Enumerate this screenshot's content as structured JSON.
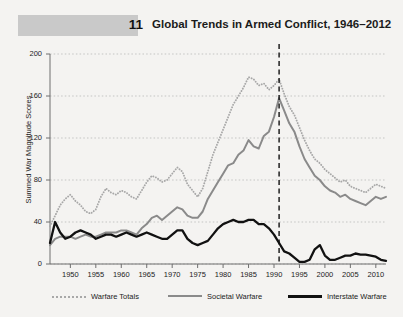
{
  "figure": {
    "number": "11",
    "title": "Global Trends in Armed Conflict, 1946–2012"
  },
  "colors": {
    "background": "#f4f3f1",
    "band": "#c9c9c9",
    "warfare_totals": "#a8a8a8",
    "societal_warfare": "#8a8a8a",
    "interstate_warfare": "#111111",
    "gridline": "#b9b9b9",
    "axis": "#6f6f6f",
    "marker_line": "#111111"
  },
  "chart_data": {
    "type": "line",
    "title": "Global Trends in Armed Conflict, 1946–2012",
    "xlabel": "",
    "ylabel": "Summed War Magnitude Scores",
    "xlim": [
      1946,
      2012
    ],
    "ylim": [
      0,
      200
    ],
    "grid": true,
    "legend_position": "bottom",
    "y_ticks": [
      0,
      40,
      80,
      120,
      160,
      200
    ],
    "x_ticks": [
      1950,
      1955,
      1960,
      1965,
      1970,
      1975,
      1980,
      1985,
      1990,
      1995,
      2000,
      2005,
      2010
    ],
    "annotations": [
      {
        "type": "vline",
        "x": 1991,
        "style": "dashed",
        "color": "#111111"
      }
    ],
    "x": [
      1946,
      1947,
      1948,
      1949,
      1950,
      1951,
      1952,
      1953,
      1954,
      1955,
      1956,
      1957,
      1958,
      1959,
      1960,
      1961,
      1962,
      1963,
      1964,
      1965,
      1966,
      1967,
      1968,
      1969,
      1970,
      1971,
      1972,
      1973,
      1974,
      1975,
      1976,
      1977,
      1978,
      1979,
      1980,
      1981,
      1982,
      1983,
      1984,
      1985,
      1986,
      1987,
      1988,
      1989,
      1990,
      1991,
      1992,
      1993,
      1994,
      1995,
      1996,
      1997,
      1998,
      1999,
      2000,
      2001,
      2002,
      2003,
      2004,
      2005,
      2006,
      2007,
      2008,
      2009,
      2010,
      2011,
      2012
    ],
    "series": [
      {
        "name": "Warfare Totals",
        "style": "dotted",
        "color": "#a8a8a8",
        "values": [
          36,
          46,
          56,
          62,
          66,
          60,
          56,
          50,
          48,
          52,
          64,
          72,
          68,
          66,
          70,
          68,
          64,
          62,
          70,
          78,
          84,
          82,
          78,
          80,
          86,
          92,
          88,
          76,
          70,
          64,
          72,
          88,
          104,
          116,
          128,
          140,
          152,
          160,
          168,
          178,
          176,
          170,
          172,
          166,
          170,
          176,
          162,
          150,
          142,
          130,
          118,
          108,
          100,
          96,
          90,
          86,
          82,
          78,
          80,
          74,
          72,
          70,
          68,
          72,
          76,
          74,
          72
        ]
      },
      {
        "name": "Societal Warfare",
        "style": "solid",
        "color": "#8a8a8a",
        "values": [
          18,
          24,
          26,
          26,
          26,
          24,
          26,
          28,
          26,
          26,
          28,
          30,
          30,
          30,
          32,
          32,
          30,
          28,
          34,
          38,
          44,
          46,
          42,
          46,
          50,
          54,
          52,
          46,
          44,
          44,
          50,
          62,
          70,
          78,
          86,
          94,
          96,
          104,
          108,
          118,
          112,
          110,
          122,
          126,
          140,
          158,
          146,
          134,
          126,
          112,
          100,
          92,
          84,
          80,
          74,
          70,
          68,
          64,
          66,
          62,
          60,
          58,
          56,
          60,
          64,
          62,
          64
        ]
      },
      {
        "name": "Interstate Warfare",
        "style": "solid",
        "color": "#111111",
        "values": [
          20,
          40,
          30,
          24,
          26,
          30,
          32,
          30,
          28,
          24,
          26,
          28,
          28,
          26,
          28,
          30,
          28,
          26,
          28,
          30,
          28,
          26,
          24,
          24,
          28,
          32,
          32,
          24,
          20,
          18,
          20,
          22,
          28,
          34,
          38,
          40,
          42,
          40,
          40,
          42,
          42,
          38,
          38,
          34,
          28,
          20,
          12,
          10,
          6,
          2,
          2,
          4,
          14,
          18,
          8,
          4,
          4,
          6,
          8,
          8,
          10,
          9,
          9,
          8,
          7,
          4,
          3
        ]
      }
    ]
  },
  "axis": {
    "y_title": "Summed War Magnitude Scores",
    "y_tick_labels": [
      "200",
      "160",
      "120",
      "80",
      "40",
      "0"
    ],
    "x_tick_labels": [
      "1950",
      "1955",
      "1960",
      "1965",
      "1970",
      "1975",
      "1980",
      "1985",
      "1990",
      "1995",
      "2000",
      "2005",
      "2010"
    ]
  },
  "legend": {
    "items": [
      {
        "label": "Warfare Totals",
        "style": "dotted"
      },
      {
        "label": "Societal Warfare",
        "style": "solid-gray"
      },
      {
        "label": "Interstate Warfare",
        "style": "solid-black"
      }
    ]
  }
}
